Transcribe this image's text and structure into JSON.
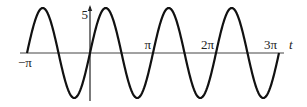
{
  "chart_data": {
    "type": "line",
    "title": "",
    "xlabel": "t",
    "ylabel": "",
    "function": "5 sin(2t)",
    "amplitude": 5,
    "angular_frequency": 2,
    "xlim": [
      -3.14159,
      9.42478
    ],
    "ylim": [
      -5,
      5
    ],
    "x_ticks": [
      {
        "value": -3.14159,
        "label": "−π"
      },
      {
        "value": 3.14159,
        "label": "π"
      },
      {
        "value": 6.28318,
        "label": "2π"
      },
      {
        "value": 9.42478,
        "label": "3π"
      }
    ],
    "y_ticks": [
      {
        "value": 5,
        "label": "5"
      }
    ],
    "series": [
      {
        "name": "y = 5 sin(2t)",
        "color": "#111111"
      }
    ],
    "grid": false,
    "legend": "none"
  }
}
